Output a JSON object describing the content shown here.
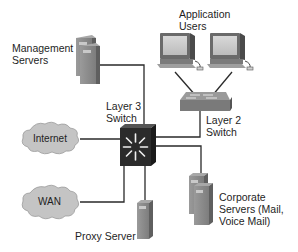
{
  "diagram": {
    "type": "network-topology",
    "nodes": {
      "management_servers": {
        "label_line1": "Management",
        "label_line2": "Servers",
        "kind": "server-stack-icon"
      },
      "application_users": {
        "label_line1": "Application",
        "label_line2": "Users",
        "kind": "workstation-icon",
        "count": 2
      },
      "layer3_switch": {
        "label_line1": "Layer 3",
        "label_line2": "Switch",
        "kind": "multilayer-switch-icon"
      },
      "layer2_switch": {
        "label_line1": "Layer 2",
        "label_line2": "Switch",
        "kind": "workgroup-switch-icon"
      },
      "internet": {
        "label": "Internet",
        "kind": "cloud-icon"
      },
      "wan": {
        "label": "WAN",
        "kind": "cloud-icon"
      },
      "proxy_server": {
        "label": "Proxy Server",
        "kind": "server-tower-icon"
      },
      "corporate_servers": {
        "label_line1": "Corporate",
        "label_line2": "Servers (Mail,",
        "label_line3": "Voice Mail)",
        "kind": "server-stack-icon"
      }
    },
    "links": [
      [
        "management_servers",
        "layer3_switch"
      ],
      [
        "internet",
        "layer3_switch"
      ],
      [
        "wan",
        "layer3_switch"
      ],
      [
        "proxy_server",
        "layer3_switch"
      ],
      [
        "layer3_switch",
        "layer2_switch"
      ],
      [
        "layer3_switch",
        "corporate_servers"
      ],
      [
        "layer2_switch",
        "application_users"
      ]
    ],
    "colors": {
      "line": "#2a2a2a",
      "device_gray": "#8e8e8e",
      "device_dark": "#5e5e5e",
      "cloud_fill": "#c4c4c4",
      "l3_switch_fill": "#2b2b2b"
    }
  }
}
